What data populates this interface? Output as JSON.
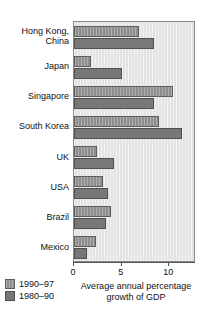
{
  "chart_data": {
    "type": "bar",
    "orientation": "horizontal",
    "title": "",
    "xlabel": "Average annual percentage growth of GDP",
    "ylabel": "",
    "xlim": [
      0,
      12.8
    ],
    "xticks": [
      0,
      5,
      10
    ],
    "xtick_labels": [
      "0",
      "5",
      "10"
    ],
    "grid": false,
    "legend_position": "bottom-left",
    "categories": [
      "Hong Kong,\nChina",
      "Japan",
      "Singapore",
      "South Korea",
      "UK",
      "USA",
      "Brazil",
      "Mexico"
    ],
    "series": [
      {
        "name": "1990–97",
        "color": "#8d8d8d",
        "values": [
          6.8,
          1.8,
          10.4,
          8.9,
          2.4,
          3.0,
          3.9,
          2.3
        ]
      },
      {
        "name": "1980–90",
        "color": "#787878",
        "values": [
          8.4,
          5.0,
          8.4,
          11.3,
          4.2,
          3.6,
          3.4,
          1.4
        ]
      }
    ]
  },
  "axis": {
    "title_line1": "Average annual percentage",
    "title_line2": "growth of GDP"
  },
  "legend": {
    "items": [
      {
        "label": "1990–97"
      },
      {
        "label": "1980–90"
      }
    ]
  }
}
